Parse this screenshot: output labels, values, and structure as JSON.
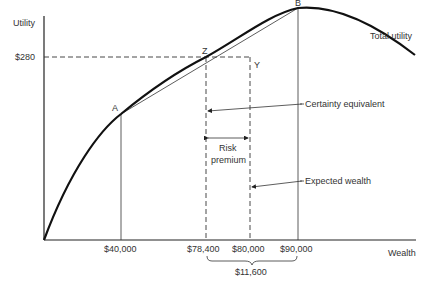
{
  "diagram": {
    "axes": {
      "y_label": "Utility",
      "x_label": "Wealth",
      "y_tick": "$280"
    },
    "curve_label": "Total utility",
    "points": {
      "A": "A",
      "B": "B",
      "Z": "Z",
      "Y": "Y"
    },
    "x_ticks": [
      "$40,000",
      "$78,400",
      "$80,000",
      "$90,000"
    ],
    "brace_label": "$11,600",
    "annotations": {
      "certainty_equivalent": "Certainty equivalent",
      "risk_premium_line1": "Risk",
      "risk_premium_line2": "premium",
      "expected_wealth": "Expected wealth"
    }
  }
}
